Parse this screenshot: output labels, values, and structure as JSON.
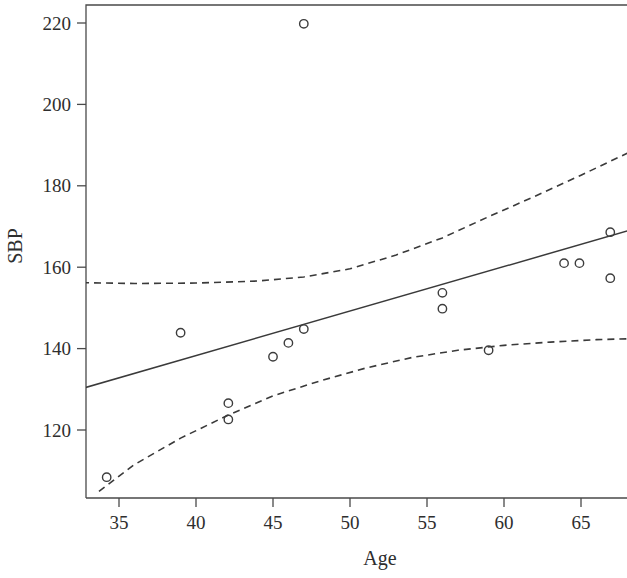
{
  "chart_data": {
    "type": "scatter",
    "title": "",
    "subtitle": "",
    "xlabel": "Age",
    "ylabel": "SBP",
    "xlim": [
      32.6,
      68.0
    ],
    "ylim": [
      104.6,
      224.4
    ],
    "grid": false,
    "legend": "none",
    "xticks": [
      35,
      40,
      45,
      50,
      55,
      60,
      65
    ],
    "xtick_labels": [
      "35",
      "40",
      "45",
      "50",
      "55",
      "60",
      "65"
    ],
    "yticks": [
      120,
      140,
      160,
      180,
      200,
      220
    ],
    "ytick_labels": [
      "120",
      "140",
      "160",
      "180",
      "200",
      "220"
    ],
    "points": [
      {
        "x": 34.2,
        "y": 108.4
      },
      {
        "x": 39.0,
        "y": 143.9
      },
      {
        "x": 42.1,
        "y": 126.6
      },
      {
        "x": 42.1,
        "y": 122.6
      },
      {
        "x": 45.0,
        "y": 138.0
      },
      {
        "x": 46.0,
        "y": 141.4
      },
      {
        "x": 47.0,
        "y": 144.8
      },
      {
        "x": 47.0,
        "y": 219.8
      },
      {
        "x": 56.0,
        "y": 153.7
      },
      {
        "x": 56.0,
        "y": 149.8
      },
      {
        "x": 59.0,
        "y": 139.6
      },
      {
        "x": 63.9,
        "y": 161.0
      },
      {
        "x": 64.9,
        "y": 161.0
      },
      {
        "x": 66.9,
        "y": 168.6
      },
      {
        "x": 66.9,
        "y": 157.3
      }
    ],
    "series": [
      {
        "name": "regression-fit",
        "style": "solid",
        "points": [
          {
            "x": 32.6,
            "y": 130.2
          },
          {
            "x": 68.0,
            "y": 168.9
          }
        ]
      },
      {
        "name": "upper-confidence-band",
        "style": "dashed",
        "points": [
          {
            "x": 32.6,
            "y": 156.2
          },
          {
            "x": 36.0,
            "y": 156.0
          },
          {
            "x": 40.0,
            "y": 156.1
          },
          {
            "x": 44.0,
            "y": 156.6
          },
          {
            "x": 47.0,
            "y": 157.6
          },
          {
            "x": 50.0,
            "y": 159.6
          },
          {
            "x": 53.0,
            "y": 163.0
          },
          {
            "x": 56.0,
            "y": 167.2
          },
          {
            "x": 59.0,
            "y": 172.4
          },
          {
            "x": 62.0,
            "y": 177.4
          },
          {
            "x": 65.0,
            "y": 182.6
          },
          {
            "x": 68.0,
            "y": 188.0
          }
        ]
      },
      {
        "name": "lower-confidence-band",
        "style": "dashed",
        "points": [
          {
            "x": 33.7,
            "y": 104.9
          },
          {
            "x": 36.0,
            "y": 111.5
          },
          {
            "x": 39.0,
            "y": 118.0
          },
          {
            "x": 42.0,
            "y": 123.5
          },
          {
            "x": 45.0,
            "y": 128.4
          },
          {
            "x": 48.0,
            "y": 132.0
          },
          {
            "x": 51.0,
            "y": 135.2
          },
          {
            "x": 54.0,
            "y": 137.8
          },
          {
            "x": 57.0,
            "y": 139.6
          },
          {
            "x": 60.0,
            "y": 140.8
          },
          {
            "x": 63.0,
            "y": 141.6
          },
          {
            "x": 66.0,
            "y": 142.2
          },
          {
            "x": 68.0,
            "y": 142.4
          }
        ]
      }
    ]
  }
}
